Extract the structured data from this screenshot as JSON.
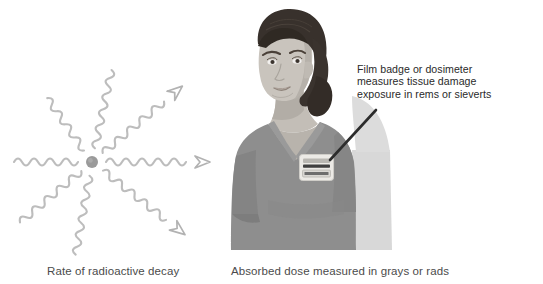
{
  "figure": {
    "background_color": "#ffffff",
    "width": 543,
    "height": 284
  },
  "captions": {
    "left": "Rate of radioactive decay",
    "right": "Absorbed dose measured in grays or rads"
  },
  "annotation": {
    "line1": "Film badge or dosimeter",
    "line2": "measures tissue damage",
    "line3": "exposure in rems or sieverts",
    "pointer_color": "#2c2c2c"
  },
  "decay_diagram": {
    "label": "radioactive-decay-rays",
    "nucleus_color": "#9a9a9a",
    "ray_color": "#bdbdbd",
    "arrow_color": "#b0b0b0",
    "nucleus_center_x": 92,
    "nucleus_center_y": 162,
    "nucleus_radius": 6,
    "ray_count": 8,
    "arrow_ray_count": 3,
    "ray_angles_degrees": [
      0,
      45,
      90,
      135,
      180,
      225,
      270,
      315
    ],
    "arrow_ray_angles_degrees": [
      0,
      40,
      -38
    ]
  },
  "person": {
    "label": "healthcare-worker-wearing-film-badge",
    "skin_color": "#c9c4bd",
    "skin_shadow_color": "#b4afa8",
    "hair_color": "#3a332e",
    "scrubs_color": "#8e8e8e",
    "scrubs_shadow_color": "#7e7e7e",
    "background_band_color": "#d6d6d6",
    "badge": {
      "label": "film-badge-dosimeter",
      "body_color": "#eceae6",
      "bar_color": "#5a5a5a",
      "x": 300,
      "y": 155,
      "width": 34,
      "height": 26
    }
  }
}
